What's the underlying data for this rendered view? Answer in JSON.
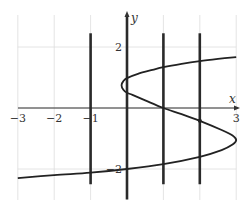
{
  "chart_data": {
    "type": "line",
    "title": "",
    "xlabel": "x",
    "ylabel": "y",
    "xlim": [
      -3,
      3
    ],
    "ylim": [
      -2.5,
      2.7
    ],
    "grid": true,
    "x_ticks": [
      {
        "value": -3,
        "label": "−3"
      },
      {
        "value": -2,
        "label": "−2"
      },
      {
        "value": -1,
        "label": "−1"
      },
      {
        "value": 3,
        "label": "3"
      }
    ],
    "y_ticks": [
      {
        "value": 2,
        "label": "2"
      },
      {
        "value": -2,
        "label": "−2"
      }
    ],
    "grid_x": [
      -3,
      -2,
      -1,
      0,
      1,
      2,
      3
    ],
    "grid_y": [
      2,
      0,
      -2
    ],
    "vertical_lines": [
      {
        "x": -1,
        "y_from": -2.5,
        "y_to": 2.45
      },
      {
        "x": 0,
        "y_from": -3.0,
        "y_to": 2.45
      },
      {
        "x": 1,
        "y_from": -2.5,
        "y_to": 2.45
      },
      {
        "x": 2,
        "y_from": -2.5,
        "y_to": 2.45
      }
    ],
    "series": [
      {
        "name": "curve",
        "color": "#222222",
        "points": [
          [
            -3,
            -2.3
          ],
          [
            -2,
            -2.2
          ],
          [
            -1,
            -2.12
          ],
          [
            0,
            -2.0
          ],
          [
            1,
            -1.84
          ],
          [
            2,
            -1.6
          ],
          [
            2.6,
            -1.38
          ],
          [
            2.9,
            -1.2
          ],
          [
            3.0,
            -1.05
          ],
          [
            2.9,
            -0.9
          ],
          [
            2.6,
            -0.72
          ],
          [
            2,
            -0.42
          ],
          [
            1.5,
            -0.2
          ],
          [
            1,
            0
          ],
          [
            0.5,
            0.25
          ],
          [
            0.15,
            0.43
          ],
          [
            0,
            0.5
          ],
          [
            -0.1,
            0.6
          ],
          [
            -0.15,
            0.75
          ],
          [
            -0.1,
            0.88
          ],
          [
            0,
            0.98
          ],
          [
            0.3,
            1.12
          ],
          [
            0.7,
            1.25
          ],
          [
            1,
            1.34
          ],
          [
            1.5,
            1.45
          ],
          [
            2,
            1.54
          ],
          [
            2.5,
            1.61
          ],
          [
            3,
            1.67
          ]
        ]
      }
    ],
    "markers": [
      {
        "x": 2,
        "y": -0.42
      }
    ]
  }
}
